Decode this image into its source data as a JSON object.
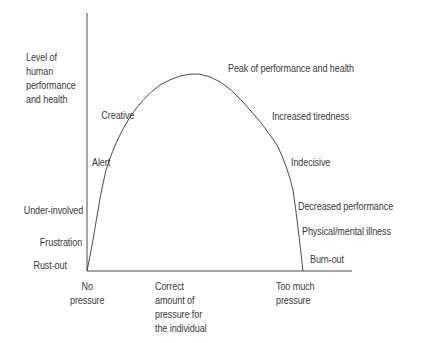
{
  "diagram": {
    "type": "inverted-U curve (pressure vs performance)",
    "y_axis_label": "Level of\nhuman\nperformance\nand health",
    "x_axis": {
      "ticks": [
        {
          "label": "No\npressure"
        },
        {
          "label": "Correct\namount of\npressure for\nthe individual"
        },
        {
          "label": "Too much\npressure"
        }
      ]
    },
    "rising_labels": [
      "Rust-out",
      "Frustration",
      "Under-involved",
      "Alert",
      "Creative"
    ],
    "peak_label": "Peak of performance and health",
    "falling_labels": [
      "Increased tiredness",
      "Indecisive",
      "Decreased performance",
      "Physical/mental illness",
      "Burn-out"
    ],
    "colors": {
      "line": "#4a4a4a",
      "text": "#3a3a3a",
      "background": "#ffffff"
    }
  }
}
